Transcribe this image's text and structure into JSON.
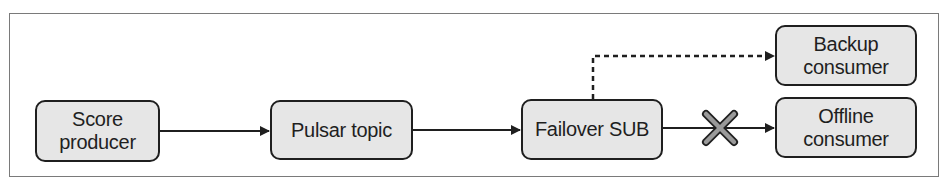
{
  "diagram": {
    "type": "flowchart",
    "colors": {
      "node_fill": "#e6e6e6",
      "node_border": "#1f1f1f",
      "edge": "#1f1f1f",
      "frame": "#7a7a7a",
      "failure_mark": "#9a9a9a"
    },
    "nodes": [
      {
        "id": "score-producer",
        "lines": [
          "Score",
          "producer"
        ]
      },
      {
        "id": "pulsar-topic",
        "lines": [
          "Pulsar topic"
        ]
      },
      {
        "id": "failover-sub",
        "lines": [
          "Failover SUB"
        ]
      },
      {
        "id": "backup-consumer",
        "lines": [
          "Backup",
          "consumer"
        ]
      },
      {
        "id": "offline-consumer",
        "lines": [
          "Offline",
          "consumer"
        ]
      }
    ],
    "edges": [
      {
        "from": "score-producer",
        "to": "pulsar-topic",
        "style": "solid"
      },
      {
        "from": "pulsar-topic",
        "to": "failover-sub",
        "style": "solid"
      },
      {
        "from": "failover-sub",
        "to": "backup-consumer",
        "style": "dashed"
      },
      {
        "from": "failover-sub",
        "to": "offline-consumer",
        "style": "solid",
        "marker": "failed-x"
      }
    ]
  }
}
